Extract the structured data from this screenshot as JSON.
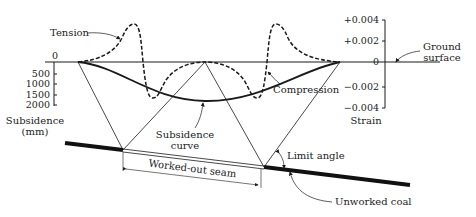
{
  "labels": {
    "tension": "Tension",
    "compression": "Compression",
    "ground_surface_1": "Ground",
    "ground_surface_2": "surface",
    "subsidence_axis_1": "Subsidence",
    "subsidence_axis_2": "(mm)",
    "strain_axis": "Strain",
    "subsidence_curve_1": "Subsidence",
    "subsidence_curve_2": "curve",
    "worked_out_seam": "Worked-out seam",
    "limit_angle": "Limit angle",
    "unworked_coal": "Unworked coal"
  },
  "subsidence_axis": {
    "ticks": [
      "0",
      "500",
      "1000",
      "1500",
      "2000"
    ]
  },
  "strain_axis": {
    "ticks": [
      "+0.004",
      "+0.002",
      "0",
      "−0.002",
      "−0.004"
    ]
  },
  "colors": {
    "line": "#1a1a1a",
    "text": "#222222",
    "background": "#ffffff"
  }
}
